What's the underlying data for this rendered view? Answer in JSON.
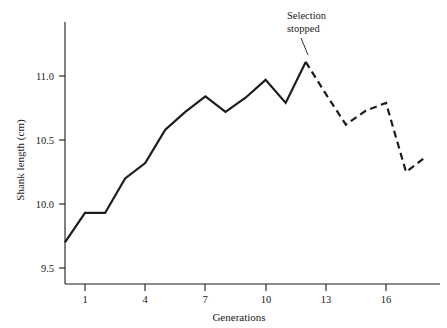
{
  "chart_data": {
    "type": "line",
    "title": "",
    "subtitle": "",
    "xlabel": "Generations",
    "ylabel": "Shank length (cm)",
    "xlim": [
      0,
      18
    ],
    "ylim": [
      9.35,
      11.35
    ],
    "grid": false,
    "legend": "none",
    "x": [
      0,
      1,
      2,
      3,
      4,
      5,
      6,
      7,
      8,
      9,
      10,
      11,
      12,
      13,
      14,
      15,
      16,
      17,
      18
    ],
    "values": [
      9.7,
      9.93,
      9.93,
      10.2,
      10.32,
      10.58,
      10.72,
      10.84,
      10.72,
      10.83,
      10.97,
      10.79,
      11.11,
      10.86,
      10.62,
      10.73,
      10.79,
      10.25,
      10.37
    ],
    "series": [
      {
        "name": "selection period",
        "style": "solid",
        "x": [
          0,
          1,
          2,
          3,
          4,
          5,
          6,
          7,
          8,
          9,
          10,
          11,
          12
        ],
        "values": [
          9.7,
          9.93,
          9.93,
          10.2,
          10.32,
          10.58,
          10.72,
          10.84,
          10.72,
          10.83,
          10.97,
          10.79,
          11.11
        ]
      },
      {
        "name": "after selection stopped",
        "style": "dashed",
        "x": [
          12,
          13,
          14,
          15,
          16,
          17,
          18
        ],
        "values": [
          11.11,
          10.86,
          10.62,
          10.73,
          10.79,
          10.25,
          10.37
        ]
      }
    ],
    "xticks": [
      1,
      4,
      7,
      10,
      13,
      16
    ],
    "xticklabels": [
      "1",
      "4",
      "7",
      "10",
      "13",
      "16"
    ],
    "yticks": [
      9.5,
      10.0,
      10.5,
      11.0
    ],
    "yticklabels": [
      "9.5",
      "10.0",
      "10.5",
      "11.0"
    ],
    "annotations": [
      {
        "name": "selection-stopped",
        "line1": "Selection",
        "line2": "stopped",
        "points_to_x": 12,
        "points_to_y": 11.11
      }
    ]
  },
  "axes": {
    "y_title": "Shank length (cm)",
    "x_title": "Generations",
    "y_tick_labels": [
      "11.0",
      "10.5",
      "10.0",
      "9.5"
    ],
    "x_tick_labels": [
      "1",
      "4",
      "7",
      "10",
      "13",
      "16"
    ]
  },
  "annotation": {
    "line1": "Selection",
    "line2": "stopped"
  },
  "colors": {
    "line": "#1c1c1c",
    "axis": "#1a1a1a",
    "background": "#ffffff"
  }
}
